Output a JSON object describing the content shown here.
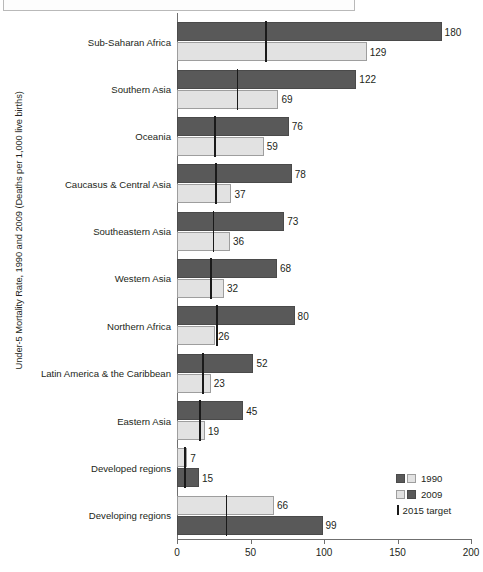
{
  "chart_data": {
    "type": "bar",
    "orientation": "horizontal",
    "title": "",
    "ylabel": "Under-5 Mortality Rate, 1990 and 2009 (Deaths per 1,000 live births)",
    "xlabel": "",
    "xlim": [
      0,
      200
    ],
    "xticks": [
      0,
      50,
      100,
      150,
      200
    ],
    "grid": false,
    "legend_position": "bottom-right",
    "categories": [
      "Sub-Saharan Africa",
      "Southern Asia",
      "Oceania",
      "Caucasus & Central Asia",
      "Southeastern Asia",
      "Western Asia",
      "Northern Africa",
      "Latin America & the Caribbean",
      "Eastern Asia",
      "Developed regions",
      "Developing regions"
    ],
    "series": [
      {
        "name": "1990",
        "color": "#595959",
        "values": [
          180,
          122,
          76,
          78,
          73,
          68,
          80,
          52,
          45,
          15,
          99
        ]
      },
      {
        "name": "2009",
        "color": "#e2e2e2",
        "values": [
          129,
          69,
          59,
          37,
          36,
          32,
          26,
          23,
          19,
          7,
          66
        ]
      }
    ],
    "target_series": {
      "name": "2015 target",
      "color": "#1a1a1a",
      "description": "two-thirds reduction from 1990 level",
      "values": [
        60,
        40.7,
        25.3,
        26,
        24.3,
        22.7,
        26.7,
        17.3,
        15,
        5,
        33
      ]
    },
    "row_order_reversed": [
      false,
      false,
      false,
      false,
      false,
      false,
      false,
      false,
      false,
      true,
      true
    ]
  },
  "legend": {
    "entries": [
      {
        "label": "1990",
        "swatches": [
          "dark",
          "light"
        ]
      },
      {
        "label": "2009",
        "swatches": [
          "light",
          "dark"
        ]
      }
    ],
    "target_label": "2015 target"
  },
  "footer": {
    "note": ""
  }
}
